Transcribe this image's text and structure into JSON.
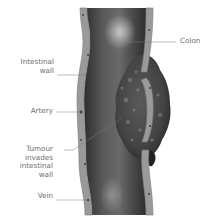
{
  "diagram": {
    "labels": {
      "colon": "Colon",
      "intestinal_wall_line1": "Intestinal",
      "intestinal_wall_line2": "wall",
      "artery": "Artery",
      "tumour_line1": "Tumour",
      "tumour_line2": "invades",
      "tumour_line3": "intestinal",
      "tumour_line4": "wall",
      "vein": "Vein"
    },
    "colors": {
      "background": "#ffffff",
      "wall": "#9a9a9a",
      "wall_edge": "#7a7a7a",
      "lumen_dark": "#3c3c3c",
      "lumen_light": "#b8b8b8",
      "tumour": "#4a4a4a",
      "tumour_spot": "#7d7d7d",
      "leader_line": "#7a7a7a",
      "label_text": "#6e6e6e",
      "vessel_dot": "#3a3a3a"
    }
  }
}
